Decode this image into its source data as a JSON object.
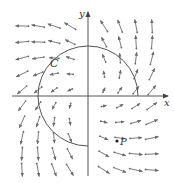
{
  "figure": {
    "width": 174,
    "height": 183,
    "origin_px": [
      88,
      96
    ],
    "grid_spacing_px": 16,
    "field": {
      "description": "F(x,y) = (x - y, x + y)",
      "arrow_color": "#6b6b6b",
      "columns_px": [
        22,
        38,
        54,
        70,
        104,
        120,
        136,
        152
      ],
      "rows_px": [
        26,
        42,
        58,
        74,
        90,
        106,
        122,
        138,
        154,
        170
      ],
      "max_length_px": 13
    },
    "axes": {
      "color": "#555555",
      "x_label": "x",
      "y_label": "y",
      "x_start_px": 12,
      "x_end_px": 168,
      "y_start_px": 176,
      "y_end_px": 12
    },
    "curve": {
      "label": "C",
      "type": "three-quarter circle, counterclockwise from (r,0) to (0,-r)",
      "radius_px": 50,
      "color": "#555555"
    },
    "point": {
      "label": "P",
      "position_px": [
        117,
        141
      ]
    }
  }
}
